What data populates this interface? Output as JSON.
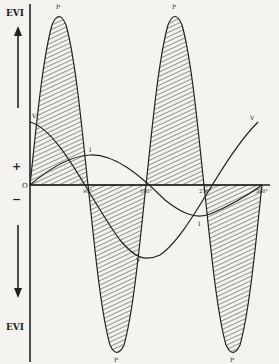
{
  "diagram": {
    "type": "alternating-current power waveform",
    "axis_labels": {
      "top": "EVI",
      "bottom": "EVI",
      "positive_sign": "+",
      "negative_sign": "−",
      "origin": "O"
    },
    "tick_labels": [
      "90°",
      "180°",
      "270°",
      "360°"
    ],
    "curve_labels": {
      "power_top_1": "P",
      "power_top_2": "P",
      "power_bottom_1": "P",
      "power_bottom_2": "P",
      "voltage_start": "V",
      "voltage_min": "V",
      "voltage_end": "V",
      "current_max": "I",
      "current_min": "I"
    },
    "colors": {
      "background": "#f4f3ef",
      "ink": "#222222"
    }
  }
}
